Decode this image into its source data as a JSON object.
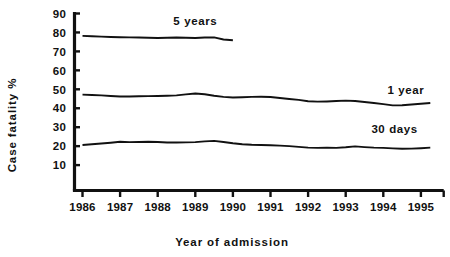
{
  "chart_data": {
    "type": "line",
    "title": "",
    "xlabel": "Year of admission",
    "ylabel": "Case fatality %",
    "x": [
      1986,
      1987,
      1988,
      1989,
      1990,
      1991,
      1992,
      1993,
      1994,
      1995
    ],
    "xlim": [
      1986,
      1995.5
    ],
    "ylim": [
      0,
      90
    ],
    "yticks": [
      10,
      20,
      30,
      40,
      50,
      60,
      70,
      80,
      90
    ],
    "xticks": [
      1986,
      1987,
      1988,
      1989,
      1990,
      1991,
      1992,
      1993,
      1994,
      1995
    ],
    "xtick_labels": [
      "1986",
      "1987",
      "1988",
      "1989",
      "1990",
      "1991",
      "1992",
      "1993",
      "1994",
      "1995"
    ],
    "ytick_labels": [
      "10",
      "20",
      "30",
      "40",
      "50",
      "60",
      "70",
      "80",
      "90"
    ],
    "grid": false,
    "legend_position": "inline-annotations",
    "series": [
      {
        "name": "5 years",
        "label_text": "5 years",
        "color": "#111111",
        "x": [
          1986.0,
          1986.25,
          1986.5,
          1986.75,
          1987.0,
          1987.25,
          1987.5,
          1987.75,
          1988.0,
          1988.25,
          1988.5,
          1988.75,
          1989.0,
          1989.25,
          1989.5,
          1989.75,
          1990.0
        ],
        "values": [
          78.2,
          78.0,
          77.8,
          77.6,
          77.5,
          77.4,
          77.3,
          77.2,
          77.1,
          77.2,
          77.3,
          77.2,
          77.1,
          77.3,
          77.4,
          76.3,
          75.9
        ]
      },
      {
        "name": "1 year",
        "label_text": "1 year",
        "color": "#111111",
        "x": [
          1986.0,
          1986.25,
          1986.5,
          1986.75,
          1987.0,
          1987.25,
          1987.5,
          1987.75,
          1988.0,
          1988.25,
          1988.5,
          1988.75,
          1989.0,
          1989.25,
          1989.5,
          1989.75,
          1990.0,
          1990.25,
          1990.5,
          1990.75,
          1991.0,
          1991.25,
          1991.5,
          1991.75,
          1992.0,
          1992.25,
          1992.5,
          1992.75,
          1993.0,
          1993.25,
          1993.5,
          1993.75,
          1994.0,
          1994.25,
          1994.5,
          1994.75,
          1995.0,
          1995.25
        ],
        "values": [
          47.2,
          47.0,
          46.8,
          46.5,
          46.2,
          46.2,
          46.3,
          46.4,
          46.5,
          46.6,
          46.8,
          47.3,
          47.8,
          47.4,
          46.6,
          46.0,
          45.7,
          45.8,
          46.0,
          46.1,
          45.9,
          45.4,
          44.9,
          44.4,
          43.7,
          43.5,
          43.6,
          43.8,
          44.0,
          43.8,
          43.3,
          42.8,
          42.2,
          41.5,
          41.6,
          42.0,
          42.4,
          42.8
        ]
      },
      {
        "name": "30 days",
        "label_text": "30 days",
        "color": "#111111",
        "x": [
          1986.0,
          1986.25,
          1986.5,
          1986.75,
          1987.0,
          1987.25,
          1987.5,
          1987.75,
          1988.0,
          1988.25,
          1988.5,
          1988.75,
          1989.0,
          1989.25,
          1989.5,
          1989.75,
          1990.0,
          1990.25,
          1990.5,
          1990.75,
          1991.0,
          1991.25,
          1991.5,
          1991.75,
          1992.0,
          1992.25,
          1992.5,
          1992.75,
          1993.0,
          1993.25,
          1993.5,
          1993.75,
          1994.0,
          1994.25,
          1994.5,
          1994.75,
          1995.0,
          1995.25
        ],
        "values": [
          20.6,
          21.0,
          21.4,
          21.8,
          22.3,
          22.1,
          22.2,
          22.3,
          22.2,
          21.9,
          21.9,
          22.0,
          22.1,
          22.5,
          22.8,
          22.2,
          21.5,
          21.0,
          20.7,
          20.6,
          20.5,
          20.3,
          20.0,
          19.6,
          19.2,
          19.1,
          19.2,
          19.1,
          19.4,
          19.9,
          19.5,
          19.2,
          19.1,
          18.8,
          18.6,
          18.7,
          18.9,
          19.2
        ]
      }
    ],
    "annotations": [
      {
        "text": "5 years",
        "x": 1989.0,
        "y": 84.0
      },
      {
        "text": "1 year",
        "x": 1994.6,
        "y": 47.5
      },
      {
        "text": "30 days",
        "x": 1994.3,
        "y": 27.0
      }
    ]
  }
}
